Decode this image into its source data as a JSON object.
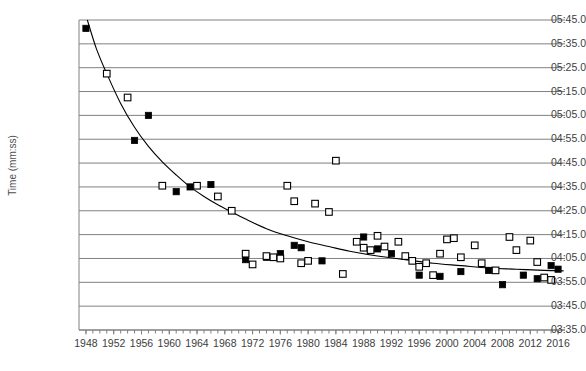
{
  "chart_data": {
    "type": "scatter",
    "title": "",
    "xlabel": "",
    "ylabel": "Time (mm:ss)",
    "grid": true,
    "legend": "none",
    "xlim": [
      1947,
      2017
    ],
    "ylim_seconds": [
      215,
      345
    ],
    "y_tick_labels": [
      "05:45.0",
      "05:35.0",
      "05:25.0",
      "05:15.0",
      "05:05.0",
      "04:55.0",
      "04:45.0",
      "04:35.0",
      "04:25.0",
      "04:15.0",
      "04:05.0",
      "03:55.0",
      "03:45.0",
      "03:35.0"
    ],
    "y_tick_seconds": [
      345,
      335,
      325,
      315,
      305,
      295,
      285,
      275,
      265,
      255,
      245,
      235,
      225,
      215
    ],
    "x_tick_labels": [
      "1948",
      "1952",
      "1956",
      "1960",
      "1964",
      "1968",
      "1972",
      "1976",
      "1980",
      "1984",
      "1988",
      "1992",
      "1996",
      "2000",
      "2004",
      "2008",
      "2012",
      "2016"
    ],
    "x_tick_values": [
      1948,
      1952,
      1956,
      1960,
      1964,
      1968,
      1972,
      1976,
      1980,
      1984,
      1988,
      1992,
      1996,
      2000,
      2004,
      2008,
      2012,
      2016
    ],
    "x_minor_tick_step": 1,
    "series": [
      {
        "name": "filled-square-series",
        "marker": "filled-square",
        "color": "#000000",
        "points": [
          {
            "x": 1948,
            "y": 341.5
          },
          {
            "x": 1955,
            "y": 294.5
          },
          {
            "x": 1957,
            "y": 305.0
          },
          {
            "x": 1961,
            "y": 273.0
          },
          {
            "x": 1963,
            "y": 275.0
          },
          {
            "x": 1966,
            "y": 276.0
          },
          {
            "x": 1971,
            "y": 244.5
          },
          {
            "x": 1974,
            "y": 245.5
          },
          {
            "x": 1976,
            "y": 247.0
          },
          {
            "x": 1978,
            "y": 250.5
          },
          {
            "x": 1979,
            "y": 249.5
          },
          {
            "x": 1982,
            "y": 244.0
          },
          {
            "x": 1988,
            "y": 254.0
          },
          {
            "x": 1990,
            "y": 249.0
          },
          {
            "x": 1992,
            "y": 247.0
          },
          {
            "x": 1996,
            "y": 238.0
          },
          {
            "x": 1999,
            "y": 237.5
          },
          {
            "x": 2002,
            "y": 239.5
          },
          {
            "x": 2006,
            "y": 240.0
          },
          {
            "x": 2008,
            "y": 234.0
          },
          {
            "x": 2011,
            "y": 238.0
          },
          {
            "x": 2013,
            "y": 236.5
          },
          {
            "x": 2015,
            "y": 242.0
          },
          {
            "x": 2016,
            "y": 240.5
          }
        ]
      },
      {
        "name": "open-square-series",
        "marker": "open-square",
        "color": "#ffffff",
        "points": [
          {
            "x": 1951,
            "y": 322.5
          },
          {
            "x": 1954,
            "y": 312.5
          },
          {
            "x": 1959,
            "y": 275.5
          },
          {
            "x": 1964,
            "y": 275.5
          },
          {
            "x": 1967,
            "y": 271.0
          },
          {
            "x": 1969,
            "y": 265.0
          },
          {
            "x": 1971,
            "y": 247.0
          },
          {
            "x": 1972,
            "y": 242.5
          },
          {
            "x": 1974,
            "y": 246.0
          },
          {
            "x": 1975,
            "y": 245.5
          },
          {
            "x": 1976,
            "y": 245.0
          },
          {
            "x": 1977,
            "y": 275.5
          },
          {
            "x": 1978,
            "y": 269.0
          },
          {
            "x": 1979,
            "y": 243.0
          },
          {
            "x": 1980,
            "y": 244.0
          },
          {
            "x": 1981,
            "y": 268.0
          },
          {
            "x": 1983,
            "y": 264.5
          },
          {
            "x": 1984,
            "y": 286.0
          },
          {
            "x": 1985,
            "y": 238.5
          },
          {
            "x": 1987,
            "y": 252.0
          },
          {
            "x": 1988,
            "y": 249.5
          },
          {
            "x": 1989,
            "y": 248.5
          },
          {
            "x": 1990,
            "y": 254.5
          },
          {
            "x": 1991,
            "y": 250.0
          },
          {
            "x": 1993,
            "y": 252.0
          },
          {
            "x": 1994,
            "y": 246.0
          },
          {
            "x": 1995,
            "y": 244.0
          },
          {
            "x": 1996,
            "y": 241.5
          },
          {
            "x": 1997,
            "y": 243.0
          },
          {
            "x": 1998,
            "y": 238.0
          },
          {
            "x": 1999,
            "y": 247.0
          },
          {
            "x": 2000,
            "y": 253.0
          },
          {
            "x": 2001,
            "y": 253.5
          },
          {
            "x": 2002,
            "y": 245.5
          },
          {
            "x": 2004,
            "y": 250.5
          },
          {
            "x": 2005,
            "y": 243.0
          },
          {
            "x": 2007,
            "y": 240.0
          },
          {
            "x": 2009,
            "y": 254.0
          },
          {
            "x": 2010,
            "y": 248.5
          },
          {
            "x": 2012,
            "y": 252.5
          },
          {
            "x": 2013,
            "y": 243.5
          },
          {
            "x": 2014,
            "y": 237.0
          },
          {
            "x": 2015,
            "y": 236.0
          }
        ]
      }
    ],
    "trendline": {
      "name": "fitted-decay-curve",
      "type": "curve",
      "color": "#000000",
      "points": [
        {
          "x": 1948.2,
          "y": 345.0
        },
        {
          "x": 1949.5,
          "y": 333.0
        },
        {
          "x": 1951.0,
          "y": 322.5
        },
        {
          "x": 1953.0,
          "y": 310.0
        },
        {
          "x": 1955.0,
          "y": 300.0
        },
        {
          "x": 1957.0,
          "y": 292.0
        },
        {
          "x": 1959.0,
          "y": 285.5
        },
        {
          "x": 1961.0,
          "y": 280.0
        },
        {
          "x": 1963.0,
          "y": 275.0
        },
        {
          "x": 1965.0,
          "y": 271.0
        },
        {
          "x": 1967.0,
          "y": 267.5
        },
        {
          "x": 1969.0,
          "y": 264.5
        },
        {
          "x": 1971.0,
          "y": 261.5
        },
        {
          "x": 1974.0,
          "y": 257.5
        },
        {
          "x": 1977.0,
          "y": 254.5
        },
        {
          "x": 1980.0,
          "y": 252.0
        },
        {
          "x": 1983.0,
          "y": 250.0
        },
        {
          "x": 1986.0,
          "y": 248.0
        },
        {
          "x": 1990.0,
          "y": 246.0
        },
        {
          "x": 1994.0,
          "y": 244.5
        },
        {
          "x": 1998.0,
          "y": 243.0
        },
        {
          "x": 2002.0,
          "y": 242.0
        },
        {
          "x": 2006.0,
          "y": 241.0
        },
        {
          "x": 2010.0,
          "y": 240.5
        },
        {
          "x": 2014.0,
          "y": 240.0
        },
        {
          "x": 2016.8,
          "y": 239.8
        }
      ]
    }
  }
}
